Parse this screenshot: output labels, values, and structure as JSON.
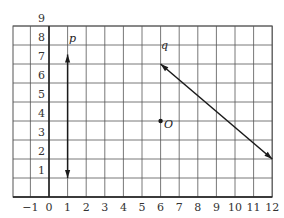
{
  "chart_data": {
    "type": "diagram",
    "title": "",
    "grid": {
      "x_range": [
        -2,
        12
      ],
      "y_range": [
        0,
        9
      ],
      "x_ticks": [
        "-1",
        "0",
        "1",
        "2",
        "3",
        "4",
        "5",
        "6",
        "7",
        "8",
        "9",
        "10",
        "11",
        "12"
      ],
      "y_ticks": [
        "1",
        "2",
        "3",
        "4",
        "5",
        "6",
        "7",
        "8",
        "9"
      ],
      "grid_on": true
    },
    "lines": [
      {
        "name": "p",
        "label": "p",
        "type": "line-with-arrows",
        "from": [
          1,
          7.5
        ],
        "to": [
          1,
          1
        ]
      },
      {
        "name": "q",
        "label": "q",
        "type": "line-with-arrows",
        "from": [
          6,
          7
        ],
        "to": [
          12,
          2
        ]
      }
    ],
    "points": [
      {
        "name": "O",
        "label": "O",
        "x": 6,
        "y": 4
      }
    ]
  },
  "labels": {
    "p": "p",
    "q": "q",
    "O": "O"
  },
  "colors": {
    "grid": "#555555",
    "axis": "#222222",
    "line": "#1a1a1a"
  }
}
